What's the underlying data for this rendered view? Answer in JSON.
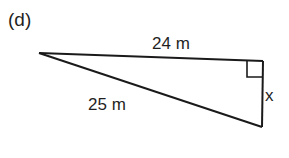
{
  "figure": {
    "part_label": "(d)",
    "shape": "right-triangle",
    "stroke_color": "#1a1a1a",
    "vertices": {
      "left": [
        39,
        53
      ],
      "right_angle": [
        263,
        61
      ],
      "bottom": [
        262,
        127
      ]
    },
    "right_angle_marker": {
      "size": 16,
      "position": "top-right corner"
    },
    "sides": {
      "top": {
        "label": "24 m",
        "value": 24,
        "unit": "m"
      },
      "hypotenuse": {
        "label": "25 m",
        "value": 25,
        "unit": "m"
      },
      "vertical": {
        "label": "x",
        "value": null,
        "unit": "m"
      }
    }
  }
}
